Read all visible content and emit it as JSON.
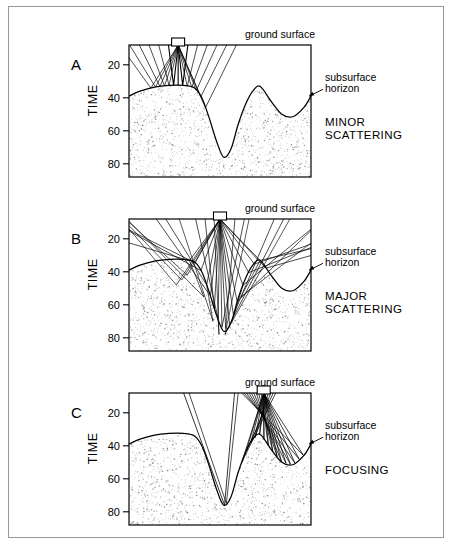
{
  "figure": {
    "axis_title": "TIME",
    "ground_label": "ground surface",
    "horizon_label_line1": "subsurface",
    "horizon_label_line2": "horizon",
    "tick_labels": [
      "20",
      "40",
      "60",
      "80"
    ],
    "tick_values": [
      20,
      40,
      60,
      80
    ]
  },
  "panels": [
    {
      "letter": "A",
      "caption_line1": "MINOR",
      "caption_line2": "SCATTERING",
      "source_x_pct": 27,
      "ray_count": 13
    },
    {
      "letter": "B",
      "caption_line1": "MAJOR",
      "caption_line2": "SCATTERING",
      "source_x_pct": 50,
      "ray_count": 17
    },
    {
      "letter": "C",
      "caption_line1": "FOCUSING",
      "caption_line2": "",
      "source_x_pct": 74,
      "ray_count": 15
    }
  ],
  "chart_data": {
    "type": "line",
    "title": "",
    "xlabel": "",
    "ylabel": "TIME",
    "ylim": [
      8,
      88
    ],
    "yticks": [
      20,
      40,
      60,
      80
    ],
    "grid": false,
    "legend": "none",
    "series": [
      {
        "name": "subsurface horizon",
        "x": [
          0,
          6,
          14,
          22,
          30,
          36,
          40,
          44,
          48,
          52,
          56,
          60,
          64,
          68,
          72,
          78,
          84,
          90,
          96,
          100
        ],
        "y": [
          39,
          36,
          33.5,
          32.5,
          32.5,
          34,
          40,
          52,
          66,
          76,
          71,
          56,
          44,
          36,
          33,
          42,
          50,
          51.5,
          46,
          39
        ]
      }
    ],
    "annotations": [
      {
        "text": "ground surface",
        "position": "top-right-outside"
      },
      {
        "text": "subsurface horizon",
        "position": "right-outside",
        "arrow_to": "horizon-curve"
      }
    ]
  },
  "colors": {
    "ink": "#000000",
    "frame": "#9a9a9a",
    "stipple": "#7b7b7b",
    "background": "#ffffff"
  },
  "icons": {
    "source_marker": "source-rectangle-icon",
    "pointer": "arrow-icon"
  }
}
